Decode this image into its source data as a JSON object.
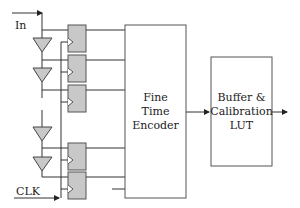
{
  "diagram": {
    "type": "block-diagram",
    "inputs": {
      "in_label": "In",
      "clk_label": "CLK"
    },
    "blocks": {
      "encoder": {
        "lines": [
          "Fine",
          "Time",
          "Encoder"
        ]
      },
      "lut": {
        "lines": [
          "Buffer &",
          "Calibration",
          "LUT"
        ]
      }
    },
    "delay_buffers": 4,
    "flip_flops": 5,
    "colors": {
      "line": "#333333",
      "fill": "#c8c8c8",
      "block_border": "#555555"
    }
  }
}
